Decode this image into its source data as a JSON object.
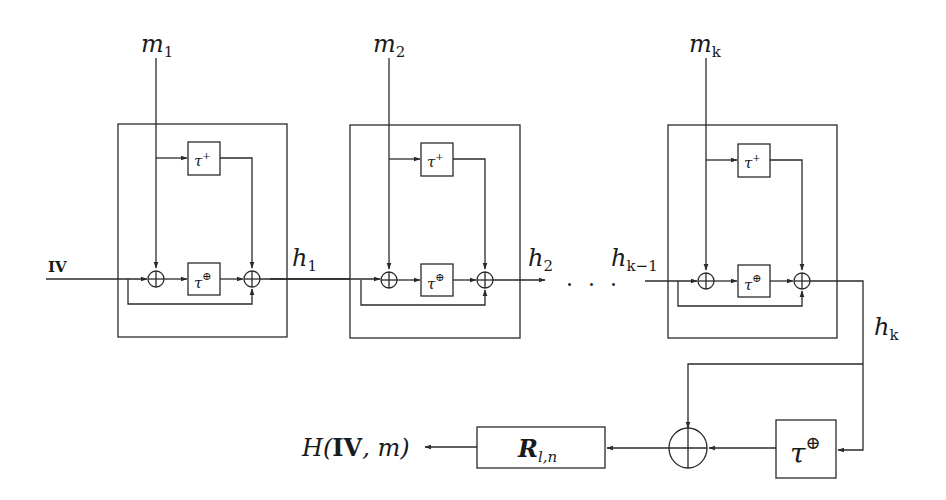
{
  "diagram": {
    "input": {
      "label": "IV"
    },
    "blocks": [
      {
        "message": {
          "var": "m",
          "sub": "1"
        },
        "tau_plus": {
          "base": "τ",
          "sup": "+"
        },
        "tau_xor": {
          "base": "τ",
          "sup": "⊕"
        },
        "output": {
          "var": "h",
          "sub": "1"
        }
      },
      {
        "message": {
          "var": "m",
          "sub": "2"
        },
        "tau_plus": {
          "base": "τ",
          "sup": "+"
        },
        "tau_xor": {
          "base": "τ",
          "sup": "⊕"
        },
        "output": {
          "var": "h",
          "sub": "2"
        }
      },
      {
        "message": {
          "var": "m",
          "sub": "k"
        },
        "input": {
          "var": "h",
          "sub": "k−1"
        },
        "tau_plus": {
          "base": "τ",
          "sup": "+"
        },
        "tau_xor": {
          "base": "τ",
          "sup": "⊕"
        },
        "output": {
          "var": "h",
          "sub": "k"
        }
      }
    ],
    "ellipsis": "· · ·",
    "finalization": {
      "tau_xor": {
        "base": "τ",
        "sup": "⊕"
      },
      "xor_symbol": "⊕",
      "round": {
        "var": "R",
        "sub": "l,n"
      },
      "output": {
        "prefix": "H(",
        "bold": "IV",
        "suffix": ", m)"
      }
    }
  }
}
